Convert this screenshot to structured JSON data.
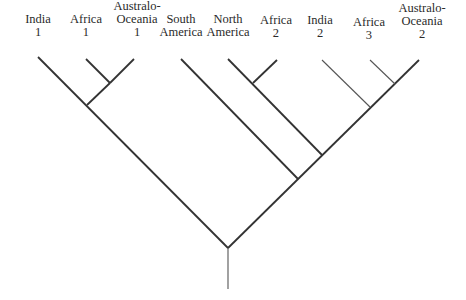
{
  "diagram": {
    "type": "phylogenetic-tree",
    "line_color": "#333333",
    "thin_line_color": "#555555",
    "taxa": [
      {
        "id": "india-1",
        "lines": [
          "India",
          "1"
        ],
        "x": 38,
        "y": 13
      },
      {
        "id": "africa-1",
        "lines": [
          "Africa",
          "1"
        ],
        "x": 86,
        "y": 13
      },
      {
        "id": "australo-oceania-1",
        "lines": [
          "Australo-",
          "Oceania",
          "1"
        ],
        "x": 137,
        "y": 0
      },
      {
        "id": "south-america",
        "lines": [
          "South",
          "America"
        ],
        "x": 181,
        "y": 13
      },
      {
        "id": "north-america",
        "lines": [
          "North",
          "America"
        ],
        "x": 228,
        "y": 13
      },
      {
        "id": "africa-2",
        "lines": [
          "Africa",
          "2"
        ],
        "x": 276,
        "y": 14
      },
      {
        "id": "india-2",
        "lines": [
          "India",
          "2"
        ],
        "x": 320,
        "y": 14
      },
      {
        "id": "africa-3",
        "lines": [
          "Africa",
          "3"
        ],
        "x": 369,
        "y": 16
      },
      {
        "id": "australo-oceania-2",
        "lines": [
          "Australo-",
          "Oceania",
          "2"
        ],
        "x": 422,
        "y": 2
      }
    ],
    "branches": [
      {
        "id": "root-stem",
        "x1": 228,
        "y1": 248,
        "x2": 228,
        "y2": 289,
        "thin": true
      },
      {
        "id": "left-main",
        "x1": 228,
        "y1": 248,
        "x2": 38,
        "y2": 57,
        "thin": false
      },
      {
        "id": "right-main",
        "x1": 228,
        "y1": 248,
        "x2": 419,
        "y2": 60,
        "thin": false
      },
      {
        "id": "africa1-ao1-clade",
        "x1": 87,
        "y1": 105,
        "x2": 110,
        "y2": 83,
        "thin": false
      },
      {
        "id": "africa-1-branch",
        "x1": 110,
        "y1": 83,
        "x2": 86,
        "y2": 59,
        "thin": false
      },
      {
        "id": "ao-1-branch",
        "x1": 110,
        "y1": 83,
        "x2": 134,
        "y2": 59,
        "thin": false
      },
      {
        "id": "south-america-branch",
        "x1": 298,
        "y1": 179,
        "x2": 181,
        "y2": 59,
        "thin": false
      },
      {
        "id": "north-america-branch",
        "x1": 322,
        "y1": 155,
        "x2": 228,
        "y2": 59,
        "thin": false
      },
      {
        "id": "africa-2-branch",
        "x1": 253,
        "y1": 83,
        "x2": 277,
        "y2": 60,
        "thin": false
      },
      {
        "id": "india-2-branch",
        "x1": 370,
        "y1": 107,
        "x2": 322,
        "y2": 60,
        "thin": true
      },
      {
        "id": "africa-3-branch",
        "x1": 395,
        "y1": 84,
        "x2": 370,
        "y2": 60,
        "thin": true
      }
    ]
  }
}
